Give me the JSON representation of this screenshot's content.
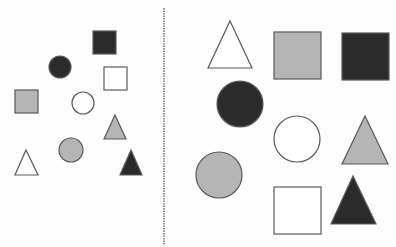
{
  "title": "Shape grouping comparison",
  "colors": {
    "background": "#fdfdfd",
    "stroke": "#5a5a5a",
    "dark": "#2b2b2b",
    "gray": "#b5b5b5",
    "white": "#ffffff",
    "divider": "#7a7a7a"
  },
  "divider": {
    "x": 164,
    "y1": 8,
    "y2": 245,
    "style": "dashed"
  },
  "panels": [
    {
      "name": "left-panel",
      "description": "Small shapes scattered",
      "shapes": [
        {
          "type": "square",
          "fill": "dark",
          "x": 93,
          "y": 31,
          "size": 23
        },
        {
          "type": "circle",
          "fill": "dark",
          "cx": 60,
          "cy": 67,
          "r": 11
        },
        {
          "type": "square",
          "fill": "white",
          "x": 104,
          "y": 67,
          "size": 23
        },
        {
          "type": "square",
          "fill": "gray",
          "x": 15,
          "y": 90,
          "size": 23
        },
        {
          "type": "circle",
          "fill": "white",
          "cx": 83,
          "cy": 103,
          "r": 11
        },
        {
          "type": "triangle",
          "fill": "gray",
          "apex": [
            115,
            115
          ],
          "base_y": 139,
          "x1": 104,
          "x2": 126
        },
        {
          "type": "circle",
          "fill": "gray",
          "cx": 71,
          "cy": 150,
          "r": 12
        },
        {
          "type": "triangle",
          "fill": "white",
          "apex": [
            26,
            150
          ],
          "base_y": 175,
          "x1": 15,
          "x2": 38
        },
        {
          "type": "triangle",
          "fill": "dark",
          "apex": [
            131,
            150
          ],
          "base_y": 175,
          "x1": 120,
          "x2": 142
        }
      ]
    },
    {
      "name": "right-panel",
      "description": "Large shapes arranged in grid",
      "shapes": [
        {
          "type": "triangle",
          "fill": "white",
          "apex": [
            230,
            21
          ],
          "base_y": 68,
          "x1": 208,
          "x2": 252
        },
        {
          "type": "square",
          "fill": "gray",
          "x": 274,
          "y": 32,
          "size": 47
        },
        {
          "type": "square",
          "fill": "dark",
          "x": 342,
          "y": 33,
          "size": 47
        },
        {
          "type": "circle",
          "fill": "dark",
          "cx": 240,
          "cy": 104,
          "r": 23
        },
        {
          "type": "circle",
          "fill": "white",
          "cx": 297,
          "cy": 139,
          "r": 23
        },
        {
          "type": "triangle",
          "fill": "gray",
          "apex": [
            365,
            116
          ],
          "base_y": 164,
          "x1": 342,
          "x2": 388
        },
        {
          "type": "circle",
          "fill": "gray",
          "cx": 219,
          "cy": 175,
          "r": 23
        },
        {
          "type": "square",
          "fill": "white",
          "x": 274,
          "y": 187,
          "size": 47
        },
        {
          "type": "triangle",
          "fill": "dark",
          "apex": [
            353,
            176
          ],
          "base_y": 224,
          "x1": 331,
          "x2": 376
        }
      ]
    }
  ]
}
